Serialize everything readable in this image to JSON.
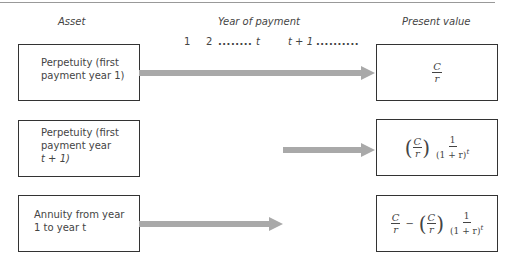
{
  "headers": {
    "asset": "Asset",
    "year_of_payment": "Year of payment",
    "present_value": "Present value"
  },
  "timeline": {
    "tick_1": "1",
    "tick_2": "2",
    "dots_1": "........",
    "tick_t": "t",
    "tick_t1": "t + 1",
    "dots_2": ".........."
  },
  "rows": [
    {
      "asset_lines": [
        "Perpetuity (first",
        "payment year 1)"
      ],
      "formula": {
        "num": "C",
        "den": "r"
      }
    },
    {
      "asset_lines": [
        "Perpetuity (first",
        "payment year",
        "t + 1)"
      ],
      "formula": {
        "paren_num": "C",
        "paren_den": "r",
        "frac_num": "1",
        "frac_den": "(1 + r)",
        "exp": "t"
      }
    },
    {
      "asset_lines": [
        "Annuity from year",
        "1 to year t"
      ],
      "formula": {
        "a_num": "C",
        "a_den": "r",
        "minus": "−",
        "paren_num": "C",
        "paren_den": "r",
        "frac_num": "1",
        "frac_den": "(1 + r)",
        "exp": "t"
      }
    }
  ],
  "colors": {
    "arrow": "#a9a9a9",
    "border": "#333333",
    "text": "#444444"
  }
}
